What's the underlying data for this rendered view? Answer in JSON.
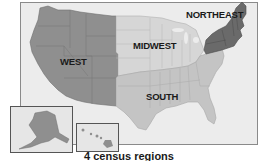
{
  "map": {
    "title": "4 census regions",
    "regions": [
      {
        "name": "WEST",
        "color": "#8f8f8f"
      },
      {
        "name": "MIDWEST",
        "color": "#d6d6d6"
      },
      {
        "name": "SOUTH",
        "color": "#c4c4c4"
      },
      {
        "name": "NORTHEAST",
        "color": "#6a6a6a"
      }
    ],
    "insets": [
      {
        "name": "alaska-inset"
      },
      {
        "name": "hawaii-inset"
      }
    ]
  }
}
